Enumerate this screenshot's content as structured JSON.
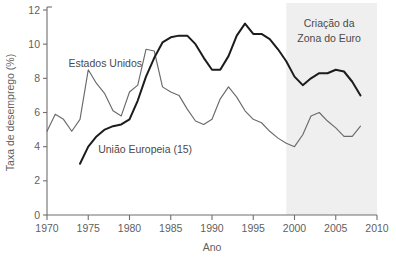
{
  "chart_data": {
    "type": "line",
    "title": "",
    "xlabel": "Ano",
    "ylabel": "Taxa de desemprego (%)",
    "xlim": [
      1970,
      2010
    ],
    "ylim": [
      0,
      12
    ],
    "xticks": [
      1970,
      1975,
      1980,
      1985,
      1990,
      1995,
      2000,
      2005,
      2010
    ],
    "xtick_labels": [
      "1970",
      "1975",
      "1980",
      "1985",
      "1990",
      "1995",
      "2000",
      "2005",
      "2010"
    ],
    "yticks": [
      0,
      2,
      4,
      6,
      8,
      10,
      12
    ],
    "ytick_labels": [
      "0",
      "2",
      "4",
      "6",
      "8",
      "10",
      "12"
    ],
    "grid": false,
    "legend": "inline-labels",
    "series": [
      {
        "name": "Estados Unidos",
        "color": "#6a6a6a",
        "label_x": 1972.6,
        "label_y": 8.85,
        "x": [
          1970,
          1971,
          1972,
          1973,
          1974,
          1975,
          1976,
          1977,
          1978,
          1979,
          1980,
          1981,
          1982,
          1983,
          1984,
          1985,
          1986,
          1987,
          1988,
          1989,
          1990,
          1991,
          1992,
          1993,
          1994,
          1995,
          1996,
          1997,
          1998,
          1999,
          2000,
          2001,
          2002,
          2003,
          2004,
          2005,
          2006,
          2007,
          2008
        ],
        "values": [
          4.9,
          5.9,
          5.6,
          4.9,
          5.6,
          8.5,
          7.7,
          7.1,
          6.1,
          5.8,
          7.2,
          7.6,
          9.7,
          9.6,
          7.5,
          7.2,
          7.0,
          6.2,
          5.5,
          5.3,
          5.6,
          6.8,
          7.5,
          6.9,
          6.1,
          5.6,
          5.4,
          4.9,
          4.5,
          4.2,
          4.0,
          4.7,
          5.8,
          6.0,
          5.5,
          5.1,
          4.6,
          4.6,
          5.2
        ]
      },
      {
        "name": "União Europeia (15)",
        "color": "#1c1c1c",
        "label_x": 1976.2,
        "label_y": 3.85,
        "x": [
          1974,
          1975,
          1976,
          1977,
          1978,
          1979,
          1980,
          1981,
          1982,
          1983,
          1984,
          1985,
          1986,
          1987,
          1988,
          1989,
          1990,
          1991,
          1992,
          1993,
          1994,
          1995,
          1996,
          1997,
          1998,
          1999,
          2000,
          2001,
          2002,
          2003,
          2004,
          2005,
          2006,
          2007,
          2008
        ],
        "values": [
          3.0,
          4.0,
          4.6,
          5.0,
          5.2,
          5.3,
          5.6,
          6.7,
          8.1,
          9.2,
          10.1,
          10.4,
          10.5,
          10.5,
          10.0,
          9.2,
          8.5,
          8.5,
          9.3,
          10.5,
          11.2,
          10.6,
          10.6,
          10.3,
          9.7,
          9.0,
          8.1,
          7.6,
          8.0,
          8.3,
          8.3,
          8.5,
          8.4,
          7.8,
          7.0
        ]
      }
    ],
    "annotations": [
      {
        "name": "euro-zone-band",
        "text_line1": "Criação da",
        "text_line2": "Zona do Euro",
        "x_start": 1999,
        "x_end": 2010,
        "text_x": 2004.2,
        "text_y_line1": 11.2,
        "text_y_line2": 10.35,
        "shade_color": "#ececec"
      }
    ]
  }
}
